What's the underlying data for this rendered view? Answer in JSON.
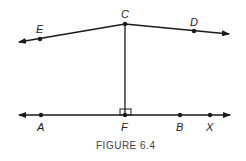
{
  "figure": {
    "caption": "FIGURE 6.4",
    "points": {
      "A": "A",
      "F": "F",
      "B": "B",
      "X": "X",
      "C": "C",
      "D": "D",
      "E": "E"
    },
    "colors": {
      "stroke": "#1a1a1a",
      "background": "#ffffff"
    }
  }
}
